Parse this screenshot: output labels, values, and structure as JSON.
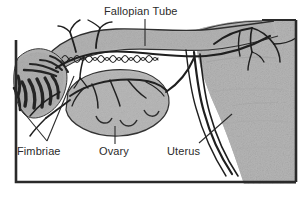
{
  "figure": {
    "title": "Fallopian Tube",
    "kind": "anatomical-line-drawing",
    "frame": {
      "border_color": "#2a2a2a",
      "background": "#ffffff"
    },
    "palette": {
      "ink": "#2b2b2b",
      "tissue_fill": "#b3b3b3",
      "tissue_fill_light": "#bdbdbd",
      "uterus_fill": "#b6b6b6",
      "vessel": "#232323",
      "outline": "#3a3a3a",
      "paper": "#ffffff"
    },
    "labels": [
      {
        "id": "fallopian-tube",
        "text": "Fallopian Tube",
        "x": 104,
        "y": 6
      },
      {
        "id": "fimbriae",
        "text": "Fimbriae",
        "x": 17,
        "y": 146
      },
      {
        "id": "ovary",
        "text": "Ovary",
        "x": 99,
        "y": 146
      },
      {
        "id": "uterus",
        "text": "Uterus",
        "x": 167,
        "y": 146
      }
    ],
    "structures": [
      {
        "id": "fallopian-tube",
        "name": "Fallopian Tube"
      },
      {
        "id": "fimbriae",
        "name": "Fimbriae"
      },
      {
        "id": "ovary",
        "name": "Ovary"
      },
      {
        "id": "uterus",
        "name": "Uterus"
      }
    ]
  }
}
